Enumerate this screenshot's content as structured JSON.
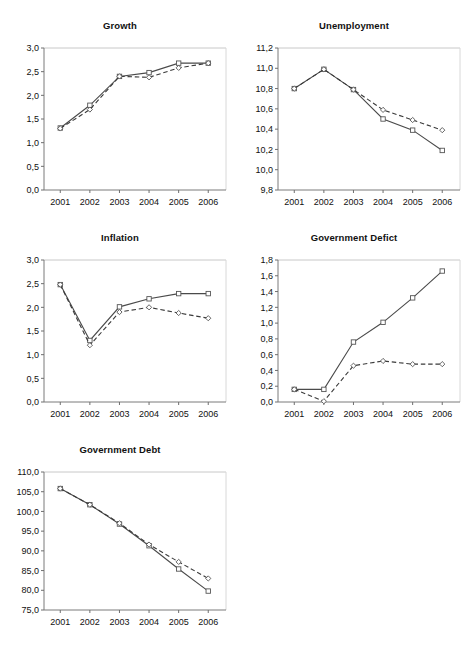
{
  "figure": {
    "title": "",
    "panel_count": 5,
    "x_categories": [
      "2001",
      "2002",
      "2003",
      "2004",
      "2005",
      "2006"
    ],
    "series_names": [
      "solid",
      "dashed"
    ]
  },
  "chart_data": [
    {
      "id": "growth",
      "type": "line",
      "title": "Growth",
      "xlabel": "",
      "ylabel": "",
      "x": [
        "2001",
        "2002",
        "2003",
        "2004",
        "2005",
        "2006"
      ],
      "ylim": [
        0.0,
        3.0
      ],
      "yticks": [
        0.0,
        0.5,
        1.0,
        1.5,
        2.0,
        2.5,
        3.0
      ],
      "ytick_labels": [
        "0,0",
        "0,5",
        "1,0",
        "1,5",
        "2,0",
        "2,5",
        "3,0"
      ],
      "grid": false,
      "legend": "none",
      "series": [
        {
          "name": "solid",
          "style": "solid",
          "marker": "square",
          "values": [
            1.31,
            1.79,
            2.4,
            2.48,
            2.68,
            2.68
          ]
        },
        {
          "name": "dashed",
          "style": "dashed",
          "marker": "diamond",
          "values": [
            1.3,
            1.7,
            2.4,
            2.38,
            2.58,
            2.68
          ]
        }
      ]
    },
    {
      "id": "unemployment",
      "type": "line",
      "title": "Unemployment",
      "xlabel": "",
      "ylabel": "",
      "x": [
        "2001",
        "2002",
        "2003",
        "2004",
        "2005",
        "2006"
      ],
      "ylim": [
        9.8,
        11.2
      ],
      "yticks": [
        9.8,
        10.0,
        10.2,
        10.4,
        10.6,
        10.8,
        11.0,
        11.2
      ],
      "ytick_labels": [
        "9,8",
        "10,0",
        "10,2",
        "10,4",
        "10,6",
        "10,8",
        "11,0",
        "11,2"
      ],
      "grid": false,
      "legend": "none",
      "series": [
        {
          "name": "solid",
          "style": "solid",
          "marker": "square",
          "values": [
            10.8,
            10.99,
            10.79,
            10.5,
            10.39,
            10.19
          ]
        },
        {
          "name": "dashed",
          "style": "dashed",
          "marker": "diamond",
          "values": [
            10.8,
            10.99,
            10.79,
            10.59,
            10.49,
            10.39
          ]
        }
      ]
    },
    {
      "id": "inflation",
      "type": "line",
      "title": "Inflation",
      "xlabel": "",
      "ylabel": "",
      "x": [
        "2001",
        "2002",
        "2003",
        "2004",
        "2005",
        "2006"
      ],
      "ylim": [
        0.0,
        3.0
      ],
      "yticks": [
        0.0,
        0.5,
        1.0,
        1.5,
        2.0,
        2.5,
        3.0
      ],
      "ytick_labels": [
        "0,0",
        "0,5",
        "1,0",
        "1,5",
        "2,0",
        "2,5",
        "3,0"
      ],
      "grid": false,
      "legend": "none",
      "series": [
        {
          "name": "solid",
          "style": "solid",
          "marker": "square",
          "values": [
            2.48,
            1.3,
            2.01,
            2.18,
            2.29,
            2.29
          ]
        },
        {
          "name": "dashed",
          "style": "dashed",
          "marker": "diamond",
          "values": [
            2.48,
            1.2,
            1.9,
            2.0,
            1.88,
            1.77
          ]
        }
      ]
    },
    {
      "id": "government-deficit",
      "type": "line",
      "title": "Government Defict",
      "xlabel": "",
      "ylabel": "",
      "x": [
        "2001",
        "2002",
        "2003",
        "2004",
        "2005",
        "2006"
      ],
      "ylim": [
        0.0,
        1.8
      ],
      "yticks": [
        0.0,
        0.2,
        0.4,
        0.6,
        0.8,
        1.0,
        1.2,
        1.4,
        1.6,
        1.8
      ],
      "ytick_labels": [
        "0,0",
        "0,2",
        "0,4",
        "0,6",
        "0,8",
        "1,0",
        "1,2",
        "1,4",
        "1,6",
        "1,8"
      ],
      "grid": false,
      "legend": "none",
      "series": [
        {
          "name": "solid",
          "style": "solid",
          "marker": "square",
          "values": [
            0.16,
            0.16,
            0.76,
            1.01,
            1.32,
            1.66
          ]
        },
        {
          "name": "dashed",
          "style": "dashed",
          "marker": "diamond",
          "values": [
            0.16,
            0.01,
            0.46,
            0.52,
            0.48,
            0.48
          ]
        }
      ]
    },
    {
      "id": "government-debt",
      "type": "line",
      "title": "Government Debt",
      "xlabel": "",
      "ylabel": "",
      "x": [
        "2001",
        "2002",
        "2003",
        "2004",
        "2005",
        "2006"
      ],
      "ylim": [
        75.0,
        110.0
      ],
      "yticks": [
        75.0,
        80.0,
        85.0,
        90.0,
        95.0,
        100.0,
        105.0,
        110.0
      ],
      "ytick_labels": [
        "75,0",
        "80,0",
        "85,0",
        "90,0",
        "95,0",
        "100,0",
        "105,0",
        "110,0"
      ],
      "grid": false,
      "legend": "none",
      "series": [
        {
          "name": "solid",
          "style": "solid",
          "marker": "square",
          "values": [
            105.8,
            101.7,
            96.8,
            91.3,
            85.4,
            79.8
          ]
        },
        {
          "name": "dashed",
          "style": "dashed",
          "marker": "diamond",
          "values": [
            105.8,
            101.7,
            97.0,
            91.6,
            87.2,
            83.0
          ]
        }
      ]
    }
  ]
}
